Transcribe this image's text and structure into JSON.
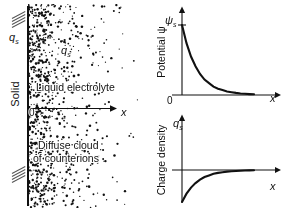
{
  "figure": {
    "width": 286,
    "height": 211,
    "background": "#ffffff",
    "ink_color": "#111111"
  },
  "left_panel": {
    "solid_label": "Solid",
    "surface_charge_label": "q",
    "surface_charge_subscript": "s",
    "cloud_charge_label": "q",
    "cloud_charge_subscript": "s",
    "liquid_label": "Liquid electrolyte",
    "diffuse_line1": "Diffuse cloud",
    "diffuse_line2": "of counterions",
    "origin_label": "0",
    "x_axis_label": "x",
    "hatching": "diagonal-hatch-marks",
    "dot_cloud": {
      "description": "counterion dots, density decaying exponentially with distance from wall",
      "n_dots": 900,
      "decay_length_px": 26
    }
  },
  "chart_data": [
    {
      "id": "potential",
      "type": "line",
      "title": "",
      "ylabel": "Potential ψ",
      "xlabel": "x",
      "y_axis_marker": "ψ",
      "y_axis_marker_subscript": "s",
      "x_tick_labels": [
        "0"
      ],
      "xlim": [
        0,
        1
      ],
      "ylim": [
        0,
        1
      ],
      "grid": false,
      "legend": false,
      "curve": "exponential decay  ψ = ψs·exp(-x/λ)",
      "x": [
        0,
        0.05,
        0.1,
        0.15,
        0.2,
        0.25,
        0.3,
        0.35,
        0.4,
        0.45,
        0.5,
        0.55,
        0.6,
        0.65,
        0.7,
        0.75,
        0.8
      ],
      "y": [
        1.0,
        0.74,
        0.55,
        0.41,
        0.3,
        0.22,
        0.17,
        0.12,
        0.09,
        0.07,
        0.05,
        0.04,
        0.03,
        0.022,
        0.017,
        0.013,
        0.01
      ]
    },
    {
      "id": "charge_density",
      "type": "line",
      "title": "",
      "ylabel": "Charge density",
      "xlabel": "x",
      "y_axis_marker": "q",
      "y_axis_marker_subscript": "s",
      "x_tick_labels": [],
      "xlim": [
        0,
        1
      ],
      "ylim": [
        -1,
        1
      ],
      "grid": false,
      "legend": false,
      "curve": "negative exponential rising to zero  q = -qs·exp(-x/λ)",
      "x": [
        0,
        0.05,
        0.1,
        0.15,
        0.2,
        0.25,
        0.3,
        0.35,
        0.4,
        0.45,
        0.5,
        0.55,
        0.6,
        0.65,
        0.7,
        0.75,
        0.8
      ],
      "y": [
        -1.0,
        -0.74,
        -0.55,
        -0.41,
        -0.3,
        -0.22,
        -0.17,
        -0.12,
        -0.09,
        -0.07,
        -0.05,
        -0.04,
        -0.03,
        -0.022,
        -0.017,
        -0.013,
        -0.01
      ]
    }
  ]
}
